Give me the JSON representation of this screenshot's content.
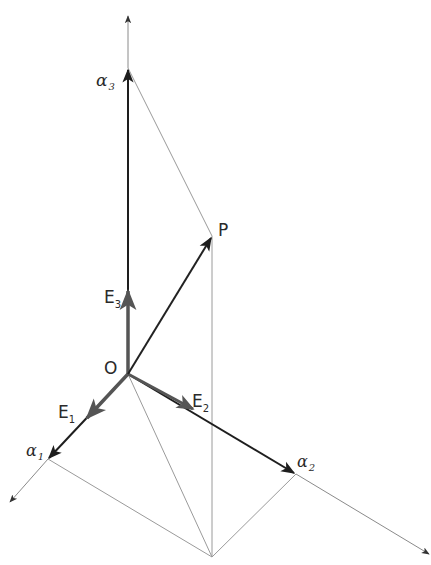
{
  "diagram": {
    "type": "3d-coordinate-vector-diagram",
    "colors": {
      "axis_heavy": "#1e1e1e",
      "axis_light": "#8a8a8a",
      "construction_line": "#9a9a9a",
      "basis_vector": "#555555",
      "vector_P": "#222222",
      "label": "#2a2a2a"
    },
    "labels": {
      "origin": "O",
      "point": "P",
      "alpha1": {
        "base": "α",
        "sub": "1"
      },
      "alpha2": {
        "base": "α",
        "sub": "2"
      },
      "alpha3": {
        "base": "α",
        "sub": "3"
      },
      "E1": {
        "base": "E",
        "sub": "1"
      },
      "E2": {
        "base": "E",
        "sub": "2"
      },
      "E3": {
        "base": "E",
        "sub": "3"
      }
    },
    "points": {
      "O": [
        128,
        374
      ],
      "P": [
        212,
        236
      ],
      "alpha1_tip": [
        48,
        459
      ],
      "alpha2_tip": [
        296,
        474
      ],
      "alpha3_tip": [
        128,
        68
      ],
      "axis1_end": [
        8,
        503
      ],
      "axis2_end": [
        431,
        555
      ],
      "axis3_end": [
        128,
        14
      ],
      "P_projection_base": [
        212,
        557
      ],
      "E1_tip": [
        86,
        419
      ],
      "E2_tip": [
        194,
        410
      ],
      "E3_tip": [
        128,
        290
      ]
    }
  }
}
